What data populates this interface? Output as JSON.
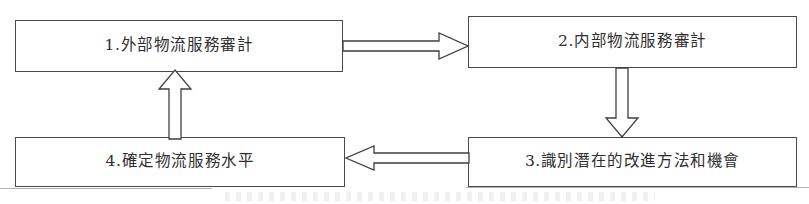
{
  "diagram": {
    "type": "cyclic-process-flow",
    "orientation": "clockwise",
    "node_count": 4,
    "arrow_count": 4,
    "colors": {
      "background": "#ffffff",
      "box_border": "#4a4a4a",
      "text": "#2e2e2e",
      "arrow_stroke": "#3f3f3f",
      "arrow_fill": "#ffffff"
    },
    "nodes": [
      {
        "id": "1",
        "number": "1.",
        "label": "1.外部物流服務審計",
        "position": "top-left"
      },
      {
        "id": "2",
        "number": "2.",
        "label": "2.内部物流服務審計",
        "position": "top-right"
      },
      {
        "id": "3",
        "number": "3.",
        "label": "3.識別潛在的改進方法和機會",
        "position": "bottom-right"
      },
      {
        "id": "4",
        "number": "4.",
        "label": "4.確定物流服務水平",
        "position": "bottom-left"
      }
    ],
    "arrows": [
      {
        "id": "top",
        "from": "1",
        "to": "2",
        "direction": "right",
        "style": "hollow-block-arrow",
        "icon": "arrow-right-icon"
      },
      {
        "id": "right",
        "from": "2",
        "to": "3",
        "direction": "down",
        "style": "hollow-block-arrow",
        "icon": "arrow-down-icon"
      },
      {
        "id": "bottom",
        "from": "3",
        "to": "4",
        "direction": "left",
        "style": "hollow-block-arrow",
        "icon": "arrow-left-icon"
      },
      {
        "id": "left",
        "from": "4",
        "to": "1",
        "direction": "up",
        "style": "hollow-block-arrow",
        "icon": "arrow-up-icon"
      }
    ]
  }
}
